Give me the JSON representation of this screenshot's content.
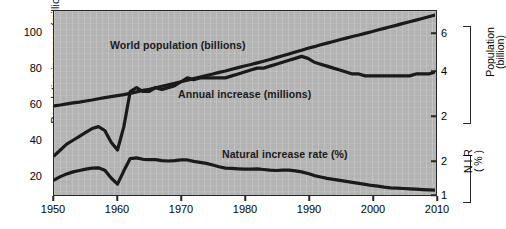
{
  "figure": {
    "background_color": "#ffffff",
    "plot_fill_color": "#b3b3b3",
    "line_color": "#1a1a1a"
  },
  "axes": {
    "left": {
      "title": "Population increase (million)",
      "ticks": [
        "20",
        "40",
        "60",
        "80",
        "100"
      ],
      "range": [
        0,
        110
      ]
    },
    "bottom": {
      "ticks": [
        "1950",
        "1960",
        "1970",
        "1980",
        "1990",
        "2000",
        "2010"
      ],
      "range": [
        1950,
        2010
      ]
    },
    "right_upper": {
      "title_line1": "Population",
      "title_line2": "(billion)",
      "ticks": [
        "2",
        "4",
        "6"
      ]
    },
    "right_lower": {
      "title_line1": "N I R",
      "title_line2": "( % )",
      "ticks": [
        "1",
        "2"
      ]
    }
  },
  "annotations": [
    {
      "name": "world-population-label",
      "text": "World population (billions)"
    },
    {
      "name": "annual-increase-label",
      "text": "Annual increase (millions)"
    },
    {
      "name": "natural-increase-rate-label",
      "text": "Natural increase rate (%)"
    }
  ],
  "chart_data": {
    "type": "line",
    "title": "",
    "xlabel": "",
    "ylabel": "Population increase (million)",
    "xlim": [
      1950,
      2010
    ],
    "ylim": [
      0,
      110
    ],
    "grid": true,
    "legend": "in-plot annotations",
    "x": [
      1950,
      1951,
      1952,
      1953,
      1954,
      1955,
      1956,
      1957,
      1958,
      1959,
      1960,
      1961,
      1962,
      1963,
      1964,
      1965,
      1966,
      1967,
      1968,
      1969,
      1970,
      1971,
      1972,
      1973,
      1974,
      1975,
      1976,
      1977,
      1978,
      1979,
      1980,
      1981,
      1982,
      1983,
      1984,
      1985,
      1986,
      1987,
      1988,
      1989,
      1990,
      1991,
      1992,
      1993,
      1994,
      1995,
      1996,
      1997,
      1998,
      1999,
      2000,
      2001,
      2002,
      2003,
      2004,
      2005,
      2006,
      2007,
      2008,
      2009,
      2010
    ],
    "series": [
      {
        "name": "World population (billions)",
        "axis": "right_upper",
        "unit": "billion",
        "values": [
          2.54,
          2.58,
          2.63,
          2.68,
          2.72,
          2.77,
          2.82,
          2.88,
          2.93,
          2.98,
          3.03,
          3.08,
          3.14,
          3.21,
          3.28,
          3.34,
          3.41,
          3.48,
          3.55,
          3.62,
          3.7,
          3.77,
          3.85,
          3.92,
          4.0,
          4.07,
          4.15,
          4.22,
          4.3,
          4.38,
          4.46,
          4.53,
          4.61,
          4.69,
          4.77,
          4.86,
          4.95,
          5.04,
          5.13,
          5.22,
          5.31,
          5.39,
          5.48,
          5.56,
          5.64,
          5.72,
          5.8,
          5.88,
          5.95,
          6.03,
          6.11,
          6.19,
          6.27,
          6.35,
          6.43,
          6.51,
          6.59,
          6.67,
          6.75,
          6.83,
          6.91
        ]
      },
      {
        "name": "Annual increase (millions)",
        "axis": "left",
        "unit": "million",
        "values": [
          37,
          40,
          43,
          45,
          47,
          49,
          51,
          52,
          50,
          44,
          40,
          52,
          70,
          72,
          70,
          70,
          72,
          71,
          72,
          73,
          75,
          77,
          76,
          77,
          77,
          77,
          77,
          77,
          78,
          79,
          80,
          81,
          82,
          82,
          83,
          84,
          85,
          86,
          87,
          88,
          87,
          85,
          84,
          83,
          82,
          81,
          80,
          79,
          79,
          78,
          78,
          78,
          78,
          78,
          78,
          78,
          78,
          79,
          79,
          79,
          80
        ]
      },
      {
        "name": "Natural increase rate (%)",
        "axis": "right_lower",
        "unit": "%",
        "values": [
          1.47,
          1.57,
          1.65,
          1.71,
          1.75,
          1.79,
          1.82,
          1.83,
          1.76,
          1.53,
          1.35,
          1.74,
          2.1,
          2.12,
          2.08,
          2.07,
          2.07,
          2.04,
          2.03,
          2.04,
          2.06,
          2.06,
          2.02,
          1.99,
          1.96,
          1.91,
          1.86,
          1.82,
          1.81,
          1.8,
          1.79,
          1.79,
          1.8,
          1.78,
          1.76,
          1.75,
          1.76,
          1.76,
          1.74,
          1.71,
          1.66,
          1.6,
          1.56,
          1.52,
          1.49,
          1.46,
          1.43,
          1.4,
          1.37,
          1.34,
          1.31,
          1.29,
          1.26,
          1.24,
          1.23,
          1.22,
          1.21,
          1.2,
          1.19,
          1.18,
          1.17
        ]
      }
    ]
  }
}
